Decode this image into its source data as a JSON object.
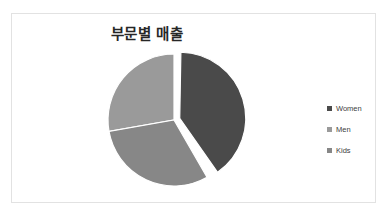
{
  "chart_data": {
    "type": "pie",
    "title": "부문별 매출",
    "xlabel": "",
    "ylabel": "",
    "grid": false,
    "legend_position": "right",
    "exploded_slice": "Women",
    "categories": [
      "Women",
      "Men",
      "Kids"
    ],
    "values": [
      40,
      32,
      28
    ],
    "colors": [
      "#4a4a4a",
      "#9a9a9a",
      "#878787"
    ],
    "slices": [
      {
        "label": "Women",
        "value": 40,
        "percent": 40,
        "color": "#4a4a4a",
        "start_angle": 1,
        "end_angle": 145,
        "exploded": true
      },
      {
        "label": "Men",
        "value": 32,
        "percent": 32,
        "color": "#9a9a9a",
        "start_angle": 260,
        "end_angle": 360,
        "exploded": false
      },
      {
        "label": "Kids",
        "value": 28,
        "percent": 28,
        "color": "#878787",
        "start_angle": 150,
        "end_angle": 260,
        "exploded": false
      }
    ]
  },
  "chart": {
    "title": "부문별 매출",
    "background": "#ffffff",
    "border_color": "#e2e2e2"
  },
  "legend": {
    "items": [
      {
        "label": "Women",
        "color": "#4a4a4a"
      },
      {
        "label": "Men",
        "color": "#9a9a9a"
      },
      {
        "label": "Kids",
        "color": "#878787"
      }
    ]
  }
}
